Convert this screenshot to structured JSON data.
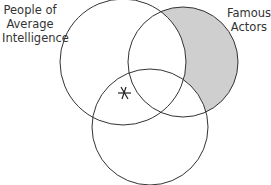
{
  "diagram": {
    "type": "venn",
    "sets": [
      {
        "id": "left",
        "label_line1": "People of",
        "label_line2": "Average",
        "label_line3": "Intelligence"
      },
      {
        "id": "right",
        "label_line1": "Famous",
        "label_line2": "Actors"
      },
      {
        "id": "bottom",
        "label": ""
      }
    ],
    "shaded_region": "right only (Famous Actors not in other circles)",
    "marker": "asterisk at intersection of left and bottom circle boundary",
    "colors": {
      "shade": "#cfcfcf",
      "stroke": "#333333"
    }
  }
}
